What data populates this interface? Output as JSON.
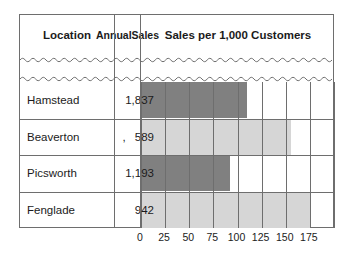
{
  "table": {
    "headers": {
      "location": "Location",
      "annual_sales": "Annual\nSales",
      "annual_sales_line1": "Annual",
      "annual_sales_line2": "Sales",
      "chart": "Sales per 1,000 Customers"
    },
    "rows": [
      {
        "location": "Hamstead",
        "annual_sales": "1,837",
        "prefix": "",
        "bar_value": 110,
        "bar_shade": "dark"
      },
      {
        "location": "Beaverton",
        "annual_sales": "589",
        "prefix": ",",
        "bar_value": 155,
        "bar_shade": "light"
      },
      {
        "location": "Picsworth",
        "annual_sales": "1,193",
        "prefix": "",
        "bar_value": 92,
        "bar_shade": "dark"
      },
      {
        "location": "Fenglade",
        "annual_sales": "942",
        "prefix": "",
        "bar_value": 175,
        "bar_shade": "light"
      }
    ]
  },
  "chart_data": {
    "type": "bar",
    "orientation": "horizontal",
    "title": "Sales per 1,000 Customers",
    "categories": [
      "Hamstead",
      "Beaverton",
      "Picsworth",
      "Fenglade"
    ],
    "values": [
      110,
      155,
      92,
      175
    ],
    "series": [
      {
        "name": "Sales per 1,000 Customers",
        "values": [
          110,
          155,
          92,
          175
        ]
      }
    ],
    "secondary_column": {
      "name": "Annual Sales",
      "values": [
        "1,837",
        "589",
        "1,193",
        "942"
      ]
    },
    "xlabel": "",
    "ylabel": "",
    "xlim": [
      0,
      200
    ],
    "xticks": [
      0,
      25,
      50,
      75,
      100,
      125,
      150,
      175
    ],
    "xtick_labels": [
      "0",
      "25",
      "50",
      "75",
      "100",
      "125",
      "150",
      "175"
    ],
    "grid": true,
    "legend": "none",
    "bar_colors": {
      "dark": "#808080",
      "light": "#d6d6d6"
    },
    "note": "Table body contains a wavy break line between the header and the first data row."
  },
  "colors": {
    "border": "#6e6e6e",
    "text": "#1b1b1b",
    "bar_dark": "#808080",
    "bar_light": "#d6d6d6",
    "background": "#ffffff"
  }
}
